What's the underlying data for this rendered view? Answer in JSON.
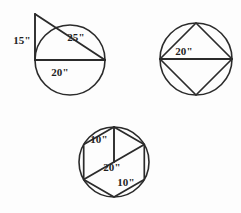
{
  "figure": {
    "background_color": "#fdfdfd",
    "stroke_color": "#2b2b2b",
    "label_color": "#1f1f1f"
  },
  "figures": [
    {
      "id": "figure-1",
      "name": "circle-with-right-triangle",
      "description": "Circle with a right triangle; vertical leg outside above the circle, hypotenuse crossing the circle, horizontal diameter at base",
      "circle": {
        "cx": 70,
        "cy": 60,
        "r": 35
      },
      "labels": [
        {
          "name": "leg-vertical-label",
          "text": "15\"",
          "x": 22,
          "y": 44
        },
        {
          "name": "hypotenuse-label",
          "text": "25\"",
          "x": 76,
          "y": 41
        },
        {
          "name": "diameter-label",
          "text": "20\"",
          "x": 60,
          "y": 76
        }
      ]
    },
    {
      "id": "figure-2",
      "name": "circle-with-inscribed-square",
      "description": "Circle with an inscribed square in diamond orientation and a horizontal diameter through the center",
      "circle": {
        "cx": 196,
        "cy": 59,
        "r": 36
      },
      "labels": [
        {
          "name": "diameter-label",
          "text": "20\"",
          "x": 184,
          "y": 55
        }
      ]
    },
    {
      "id": "figure-3",
      "name": "circle-with-inscribed-hexagon",
      "description": "Circle with an inscribed regular hexagon, a radius segment from top vertex to center, and a long diagonal",
      "circle": {
        "cx": 114,
        "cy": 162,
        "r": 35
      },
      "labels": [
        {
          "name": "radius-label",
          "text": "10\"",
          "x": 99,
          "y": 143
        },
        {
          "name": "diagonal-label",
          "text": "20\"",
          "x": 112,
          "y": 171
        },
        {
          "name": "side-label",
          "text": "10\"",
          "x": 126,
          "y": 186
        }
      ]
    }
  ]
}
